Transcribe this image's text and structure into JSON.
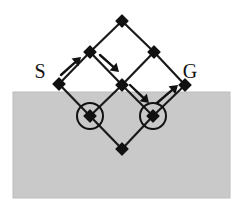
{
  "figure": {
    "canvas": {
      "width": 244,
      "height": 215
    },
    "colors": {
      "background": "#ffffff",
      "shaded_region": "#c9c9c9",
      "shaded_region_border": "#bdbdbd",
      "edge": "#1a1a1a",
      "node": "#111111",
      "circle": "#111111",
      "arrow": "#111111",
      "label": "#111111"
    }
  },
  "shaded_region": {
    "name": "obstacle-region",
    "x": 13,
    "y": 92,
    "width": 217,
    "height": 106
  },
  "labels": [
    {
      "id": "S",
      "text": "S",
      "x": 40,
      "y": 78,
      "role": "start-label"
    },
    {
      "id": "G",
      "text": "G",
      "x": 190,
      "y": 78,
      "role": "goal-label"
    }
  ],
  "nodes": [
    {
      "id": "top",
      "x": 122,
      "y": 21,
      "circled": false
    },
    {
      "id": "upper-left",
      "x": 90,
      "y": 52,
      "circled": false
    },
    {
      "id": "upper-right",
      "x": 154,
      "y": 52,
      "circled": false
    },
    {
      "id": "start",
      "x": 59,
      "y": 84,
      "circled": false
    },
    {
      "id": "center",
      "x": 122,
      "y": 85,
      "circled": false
    },
    {
      "id": "goal",
      "x": 185,
      "y": 85,
      "circled": false
    },
    {
      "id": "blocked-left",
      "x": 90,
      "y": 116,
      "circled": true
    },
    {
      "id": "blocked-right",
      "x": 153,
      "y": 116,
      "circled": true
    },
    {
      "id": "bottom",
      "x": 122,
      "y": 149,
      "circled": false
    }
  ],
  "edges": [
    {
      "from": "start",
      "to": "upper-left"
    },
    {
      "from": "upper-left",
      "to": "top"
    },
    {
      "from": "top",
      "to": "upper-right"
    },
    {
      "from": "upper-right",
      "to": "goal"
    },
    {
      "from": "upper-left",
      "to": "center"
    },
    {
      "from": "center",
      "to": "upper-right"
    },
    {
      "from": "start",
      "to": "blocked-left"
    },
    {
      "from": "blocked-left",
      "to": "center"
    },
    {
      "from": "center",
      "to": "blocked-right"
    },
    {
      "from": "blocked-right",
      "to": "goal"
    },
    {
      "from": "blocked-left",
      "to": "bottom"
    },
    {
      "from": "bottom",
      "to": "blocked-right"
    }
  ],
  "arrows": [
    {
      "id": "arrow-1",
      "x1": 61,
      "y1": 75,
      "x2": 81,
      "y2": 57,
      "direction": "up-right"
    },
    {
      "id": "arrow-2",
      "x1": 100,
      "y1": 55,
      "x2": 119,
      "y2": 72,
      "direction": "down-right"
    },
    {
      "id": "arrow-3",
      "x1": 130,
      "y1": 85,
      "x2": 149,
      "y2": 103,
      "direction": "down-right"
    },
    {
      "id": "arrow-4",
      "x1": 157,
      "y1": 103,
      "x2": 178,
      "y2": 85,
      "direction": "up-right"
    }
  ],
  "circle_markers": [
    {
      "id": "marker-left",
      "cx": 90,
      "cy": 116,
      "r": 13
    },
    {
      "id": "marker-right",
      "cx": 153,
      "cy": 116,
      "r": 13
    }
  ],
  "geometry": {
    "node_size": 6,
    "edge_width": 2.2,
    "circle_width": 2.0,
    "arrow_width": 2.4,
    "arrow_head": 5.5
  }
}
